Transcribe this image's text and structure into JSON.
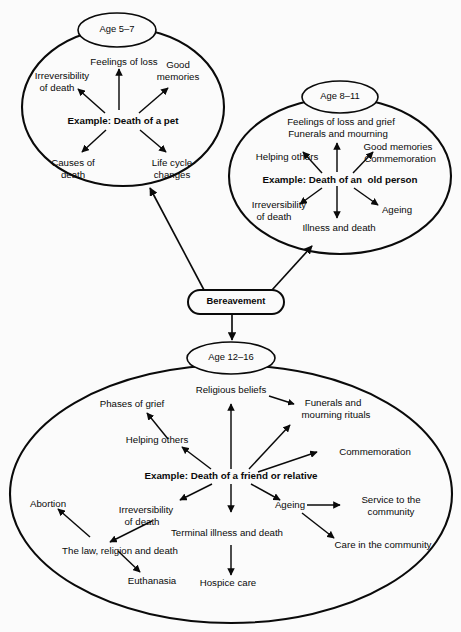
{
  "page": {
    "header_fragment": "",
    "background_color": "#fbfbfb",
    "ink_color": "#0a0a0a",
    "width": 461,
    "height": 632
  },
  "centre": {
    "label": "Bereavement"
  },
  "clusters": [
    {
      "id": "age-5-7",
      "ring_label": "Age 5–7",
      "example": "Example: Death of a pet",
      "nodes": [
        {
          "id": "feelings-of-loss",
          "lines": [
            "Feelings of loss"
          ]
        },
        {
          "id": "good-memories",
          "lines": [
            "Good",
            "memories"
          ]
        },
        {
          "id": "irreversibility-of-death",
          "lines": [
            "Irreversibility",
            "of death"
          ]
        },
        {
          "id": "causes-of-death",
          "lines": [
            "Causes of",
            "death"
          ]
        },
        {
          "id": "life-cycle-changes",
          "lines": [
            "Life cycle",
            "changes"
          ]
        }
      ]
    },
    {
      "id": "age-8-11",
      "ring_label": "Age 8–11",
      "example": "Example: Death of an  old person",
      "nodes": [
        {
          "id": "feelings-of-loss-and-grief",
          "lines": [
            "Feelings of loss and grief"
          ]
        },
        {
          "id": "funerals-and-mourning",
          "lines": [
            "Funerals and mourning"
          ]
        },
        {
          "id": "helping-others",
          "lines": [
            "Helping others"
          ]
        },
        {
          "id": "good-memories",
          "lines": [
            "Good memories"
          ]
        },
        {
          "id": "commemoration",
          "lines": [
            "Commemoration"
          ]
        },
        {
          "id": "irreversibility-of-death",
          "lines": [
            "Irreversibility",
            "of death"
          ]
        },
        {
          "id": "ageing",
          "lines": [
            "Ageing"
          ]
        },
        {
          "id": "illness-and-death",
          "lines": [
            "Illness and death"
          ]
        }
      ]
    },
    {
      "id": "age-12-16",
      "ring_label": "Age 12–16",
      "example": "Example: Death of a friend or relative",
      "nodes": [
        {
          "id": "religious-beliefs",
          "lines": [
            "Religious beliefs"
          ]
        },
        {
          "id": "funerals-and-mourning-rituals",
          "lines": [
            "Funerals and",
            "mourning rituals"
          ]
        },
        {
          "id": "commemoration",
          "lines": [
            "Commemoration"
          ]
        },
        {
          "id": "phases-of-grief",
          "lines": [
            "Phases of grief"
          ]
        },
        {
          "id": "helping-others",
          "lines": [
            "Helping others"
          ]
        },
        {
          "id": "abortion",
          "lines": [
            "Abortion"
          ]
        },
        {
          "id": "irreversibility-of-death",
          "lines": [
            "Irreversibility",
            "of death"
          ]
        },
        {
          "id": "the-law-religion-and-death",
          "lines": [
            "The law, religion and death"
          ]
        },
        {
          "id": "euthanasia",
          "lines": [
            "Euthanasia"
          ]
        },
        {
          "id": "terminal-illness-and-death",
          "lines": [
            "Terminal illness and death"
          ]
        },
        {
          "id": "hospice-care",
          "lines": [
            "Hospice care"
          ]
        },
        {
          "id": "ageing",
          "lines": [
            "Ageing"
          ]
        },
        {
          "id": "service-to-the-community",
          "lines": [
            "Service to the",
            "community"
          ]
        },
        {
          "id": "care-in-the-community",
          "lines": [
            "Care in the community"
          ]
        }
      ]
    }
  ]
}
